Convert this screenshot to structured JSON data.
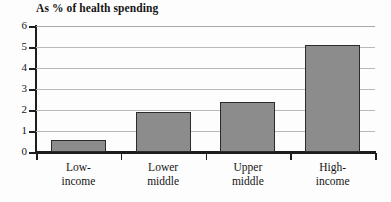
{
  "chart_data": {
    "type": "bar",
    "title": "As % of health spending",
    "xlabel": "",
    "ylabel": "",
    "ylim": [
      0,
      6
    ],
    "yticks": [
      0,
      1,
      2,
      3,
      4,
      5,
      6
    ],
    "grid": true,
    "legend": false,
    "categories": [
      "Low-income",
      "Lower middle",
      "Upper middle",
      "High-income"
    ],
    "category_lines": [
      [
        "Low-",
        "income"
      ],
      [
        "Lower",
        "middle"
      ],
      [
        "Upper",
        "middle"
      ],
      [
        "High-",
        "income"
      ]
    ],
    "values": [
      0.55,
      1.9,
      2.4,
      5.1
    ],
    "colors": {
      "bar_fill": "#8c8c8c",
      "bar_border": "#2b2b2b",
      "gridline": "#b9b9b9",
      "axis": "#1d1d1d",
      "background": "#fdfdfd",
      "text": "#151515"
    }
  }
}
